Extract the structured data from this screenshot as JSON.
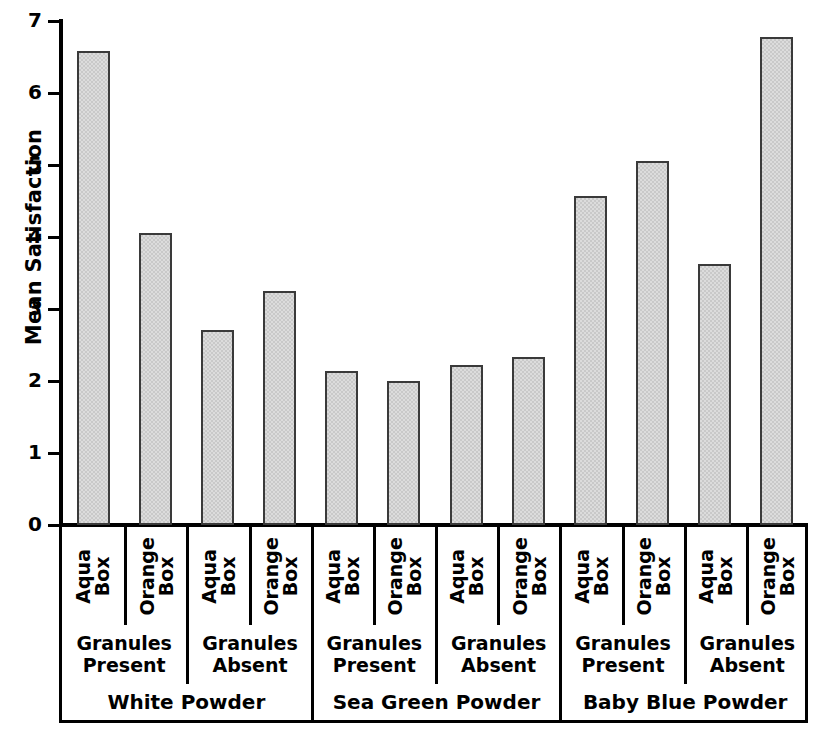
{
  "chart_data": {
    "type": "bar",
    "title": "",
    "xlabel": "",
    "ylabel": "Mean Satisfaction",
    "ylim": [
      0,
      7
    ],
    "ytick_labels": [
      "0",
      "1",
      "2",
      "3",
      "4",
      "5",
      "6",
      "7"
    ],
    "ytick_values": [
      0,
      1,
      2,
      3,
      4,
      5,
      6,
      7
    ],
    "grid": false,
    "legend": "none",
    "categories": [
      "White Powder / Granules Present / Aqua Box",
      "White Powder / Granules Present / Orange Box",
      "White Powder / Granules Absent / Aqua Box",
      "White Powder / Granules Absent / Orange Box",
      "Sea Green Powder / Granules Present / Aqua Box",
      "Sea Green Powder / Granules Present / Orange Box",
      "Sea Green Powder / Granules Absent / Aqua Box",
      "Sea Green Powder / Granules Absent / Orange Box",
      "Baby Blue Powder / Granules Present / Aqua Box",
      "Baby Blue Powder / Granules Present / Orange Box",
      "Baby Blue Powder / Granules Absent / Aqua Box",
      "Baby Blue Powder / Granules Absent / Orange Box"
    ],
    "values": [
      6.59,
      4.05,
      2.71,
      3.25,
      2.14,
      2.0,
      2.22,
      2.34,
      4.57,
      5.06,
      3.62,
      6.78
    ],
    "bar_color": "#c9c9c9",
    "bar_edge_color": "#3a3a3a"
  },
  "axes": {
    "ylabel": "Mean Satisfaction",
    "yticks": [
      {
        "label": "7",
        "value": 7
      },
      {
        "label": "6",
        "value": 6
      },
      {
        "label": "5",
        "value": 5
      },
      {
        "label": "4",
        "value": 4
      },
      {
        "label": "3",
        "value": 3
      },
      {
        "label": "2",
        "value": 2
      },
      {
        "label": "1",
        "value": 1
      },
      {
        "label": "0",
        "value": 0
      }
    ]
  },
  "xlabels": {
    "box_level": [
      {
        "line1": "Aqua",
        "line2": "Box"
      },
      {
        "line1": "Orange",
        "line2": "Box"
      },
      {
        "line1": "Aqua",
        "line2": "Box"
      },
      {
        "line1": "Orange",
        "line2": "Box"
      },
      {
        "line1": "Aqua",
        "line2": "Box"
      },
      {
        "line1": "Orange",
        "line2": "Box"
      },
      {
        "line1": "Aqua",
        "line2": "Box"
      },
      {
        "line1": "Orange",
        "line2": "Box"
      },
      {
        "line1": "Aqua",
        "line2": "Box"
      },
      {
        "line1": "Orange",
        "line2": "Box"
      },
      {
        "line1": "Aqua",
        "line2": "Box"
      },
      {
        "line1": "Orange",
        "line2": "Box"
      }
    ],
    "granules_level": [
      {
        "line1": "Granules",
        "line2": "Present"
      },
      {
        "line1": "Granules",
        "line2": "Absent"
      },
      {
        "line1": "Granules",
        "line2": "Present"
      },
      {
        "line1": "Granules",
        "line2": "Absent"
      },
      {
        "line1": "Granules",
        "line2": "Present"
      },
      {
        "line1": "Granules",
        "line2": "Absent"
      }
    ],
    "powder_level": [
      {
        "label": "White Powder"
      },
      {
        "label": "Sea Green Powder"
      },
      {
        "label": "Baby Blue Powder"
      }
    ]
  }
}
